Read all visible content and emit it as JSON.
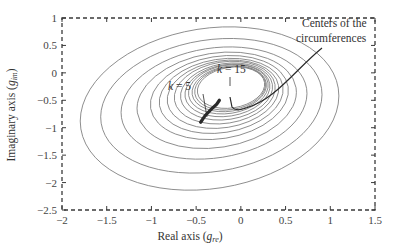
{
  "chart_data": {
    "type": "line",
    "title": "",
    "xlabel": "Real axis (g_re)",
    "ylabel": "Imaginary axis (g_im)",
    "xlabel_parts": {
      "main": "Real axis (",
      "sym": "g",
      "sub": "re",
      "end": ")"
    },
    "ylabel_parts": {
      "main": "Imaginary axis (",
      "sym": "g",
      "sub": "im",
      "end": ")"
    },
    "xlim": [
      -2,
      1.5
    ],
    "ylim": [
      -2.5,
      1
    ],
    "x_ticks": [
      -2,
      -1.5,
      -1,
      -0.5,
      0,
      0.5,
      1,
      1.5
    ],
    "y_ticks": [
      1,
      0.5,
      0,
      -0.5,
      -1,
      -1.5,
      -2,
      -2.5
    ],
    "x_tick_labels": [
      "−2",
      "−1.5",
      "−1",
      "−0.5",
      "0",
      "0.5",
      "1",
      "1.5"
    ],
    "y_tick_labels": [
      "1",
      "0.5",
      "0",
      "−0.5",
      "−1",
      "−1.5",
      "−2",
      "−2.5"
    ],
    "grid": false,
    "frame_style": "dashed",
    "ellipses": [
      {
        "cx": -0.35,
        "cy": -0.65,
        "rx": 1.46,
        "ry": 1.46
      },
      {
        "cx": -0.33,
        "cy": -0.6,
        "rx": 1.25,
        "ry": 1.2
      },
      {
        "cx": -0.3,
        "cy": -0.55,
        "rx": 1.05,
        "ry": 1.0
      },
      {
        "cx": -0.27,
        "cy": -0.5,
        "rx": 0.9,
        "ry": 0.86
      },
      {
        "cx": -0.24,
        "cy": -0.45,
        "rx": 0.78,
        "ry": 0.75
      },
      {
        "cx": -0.22,
        "cy": -0.42,
        "rx": 0.7,
        "ry": 0.67
      },
      {
        "cx": -0.2,
        "cy": -0.39,
        "rx": 0.63,
        "ry": 0.61
      },
      {
        "cx": -0.18,
        "cy": -0.36,
        "rx": 0.57,
        "ry": 0.56
      },
      {
        "cx": -0.16,
        "cy": -0.34,
        "rx": 0.52,
        "ry": 0.51
      },
      {
        "cx": -0.15,
        "cy": -0.32,
        "rx": 0.48,
        "ry": 0.47
      },
      {
        "cx": -0.14,
        "cy": -0.3,
        "rx": 0.45,
        "ry": 0.44
      },
      {
        "cx": -0.13,
        "cy": -0.29,
        "rx": 0.42,
        "ry": 0.41
      },
      {
        "cx": -0.12,
        "cy": -0.28,
        "rx": 0.4,
        "ry": 0.39
      },
      {
        "cx": -0.11,
        "cy": -0.27,
        "rx": 0.38,
        "ry": 0.37
      }
    ],
    "center_trail": {
      "start_label": "k = 5",
      "end_label": "k = 15",
      "points": [
        [
          -0.45,
          -0.9
        ],
        [
          -0.4,
          -0.78
        ],
        [
          -0.33,
          -0.66
        ],
        [
          -0.27,
          -0.57
        ],
        [
          -0.24,
          -0.5
        ]
      ]
    },
    "annotations": [
      {
        "text": "k = 5",
        "x": -0.62,
        "y": -0.62
      },
      {
        "text": "k = 15",
        "x": -0.38,
        "y": -0.35
      },
      {
        "text_lines": [
          "Centers of the",
          "circumferences"
        ],
        "x": 0.9,
        "y": 0.75
      }
    ]
  },
  "labels": {
    "k5_k": "k",
    "k5_rest": " = 5",
    "k15_k": "k",
    "k15_rest": " = 15",
    "centers_line1": "Centers of the",
    "centers_line2": "circumferences"
  },
  "colors": {
    "contour": "#7a7a7a",
    "frame": "#3a3a3a",
    "trail": "#2a2a2a",
    "text": "#333333"
  }
}
